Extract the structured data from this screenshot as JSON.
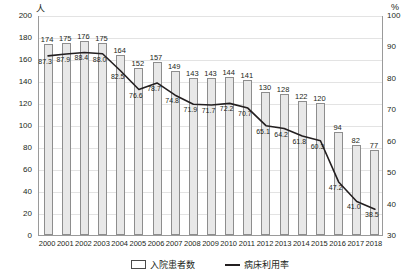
{
  "axes": {
    "left_unit": "人",
    "right_unit": "%",
    "left_ticks": [
      "200",
      "180",
      "160",
      "140",
      "120",
      "100",
      "80",
      "60",
      "40",
      "20",
      "0"
    ],
    "right_ticks": [
      "100",
      "90",
      "80",
      "70",
      "60",
      "50",
      "40",
      "30"
    ]
  },
  "legend": {
    "bar_label": "入院患者数",
    "line_label": "病床利用率"
  },
  "chart_data": {
    "type": "bar",
    "title": "",
    "xlabel": "",
    "ylabel": "人",
    "y2label": "%",
    "ylim": [
      0,
      200
    ],
    "y2lim": [
      30,
      100
    ],
    "grid": true,
    "legend_position": "bottom",
    "categories": [
      "2000",
      "2001",
      "2002",
      "2003",
      "2004",
      "2005",
      "2006",
      "2007",
      "2008",
      "2009",
      "2010",
      "2011",
      "2012",
      "2013",
      "2014",
      "2015",
      "2016",
      "2017",
      "2018"
    ],
    "series": [
      {
        "name": "入院患者数",
        "type": "bar",
        "axis": "left",
        "unit": "人",
        "values": [
          174,
          175,
          176,
          175,
          164,
          152,
          157,
          149,
          143,
          143,
          144,
          141,
          130,
          128,
          122,
          120,
          94,
          82,
          77
        ],
        "labels": [
          "174",
          "175",
          "176",
          "175",
          "164",
          "152",
          "157",
          "149",
          "143",
          "143",
          "144",
          "141",
          "130",
          "128",
          "122",
          "120",
          "94",
          "82",
          "77"
        ]
      },
      {
        "name": "病床利用率",
        "type": "line",
        "axis": "right",
        "unit": "%",
        "values": [
          87.3,
          87.9,
          88.4,
          88.0,
          82.5,
          76.6,
          78.7,
          74.8,
          71.9,
          71.7,
          72.2,
          70.7,
          65.1,
          64.2,
          61.8,
          60.3,
          47.2,
          41.0,
          38.5
        ],
        "labels": [
          "87.3",
          "87.9",
          "88.4",
          "88.0",
          "82.5",
          "76.6",
          "78.7",
          "74.8",
          "71.9",
          "71.7",
          "72.2",
          "70.7",
          "65.1",
          "64.2",
          "61.8",
          "60.3",
          "47.2",
          "41.0",
          "38.5"
        ]
      }
    ],
    "colors": {
      "bar_fill": "#e8e8e8",
      "bar_stroke": "#8d8d8d",
      "line": "#231f20",
      "grid": "#e3e3e3",
      "axis": "#9a9a9a",
      "text": "#231f20"
    }
  }
}
